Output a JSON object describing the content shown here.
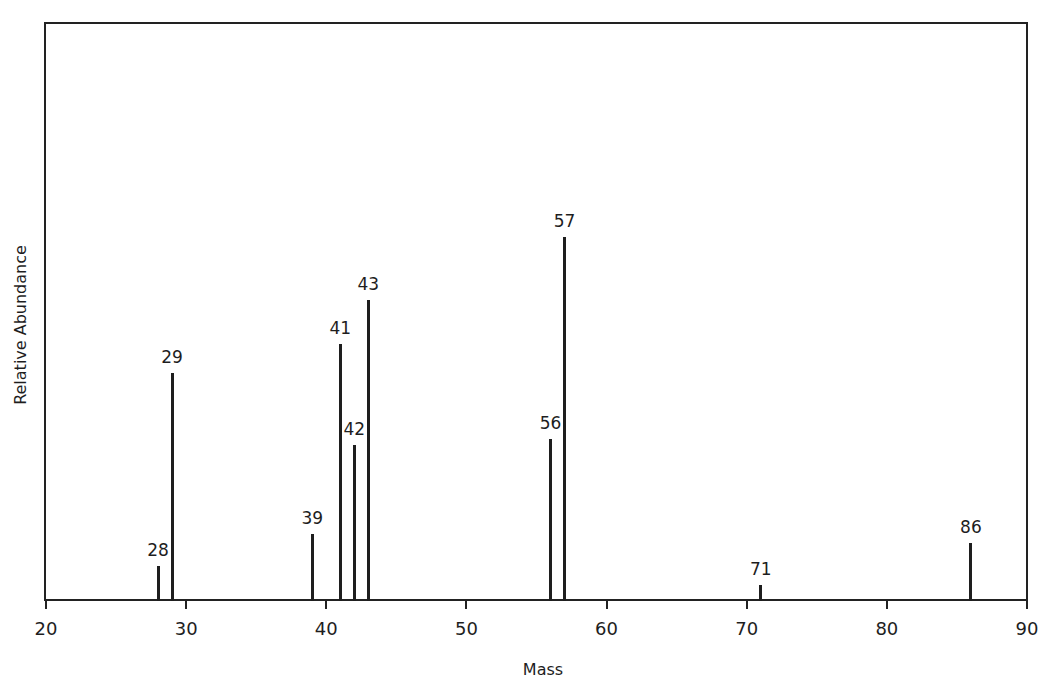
{
  "chart_data": {
    "type": "bar",
    "subtype": "mass-spectrum-stick-plot",
    "title": "",
    "xlabel": "Mass",
    "ylabel": "Relative Abundance",
    "xlim": [
      20,
      90
    ],
    "ylim": [
      0,
      158
    ],
    "x_ticks": [
      20,
      30,
      40,
      50,
      60,
      70,
      80,
      90
    ],
    "y_ticks": [],
    "grid": false,
    "legend": null,
    "normalization": "base peak (m/z 57) = 100, estimated from bar heights",
    "categories": [
      "28",
      "29",
      "39",
      "41",
      "42",
      "43",
      "56",
      "57",
      "71",
      "86"
    ],
    "x": [
      28,
      29,
      39,
      41,
      42,
      43,
      56,
      57,
      71,
      86
    ],
    "values": [
      9.6,
      62.6,
      18.4,
      70.6,
      42.9,
      82.7,
      44.5,
      100,
      4.4,
      15.9
    ],
    "annotations": [
      "28",
      "29",
      "39",
      "41",
      "42",
      "43",
      "56",
      "57",
      "71",
      "86"
    ]
  },
  "axes": {
    "xlabel": "Mass",
    "ylabel": "Relative Abundance",
    "tick_labels": [
      "20",
      "30",
      "40",
      "50",
      "60",
      "70",
      "80",
      "90"
    ]
  },
  "colors": {
    "line": "#1e1e1e",
    "background": "#ffffff"
  }
}
